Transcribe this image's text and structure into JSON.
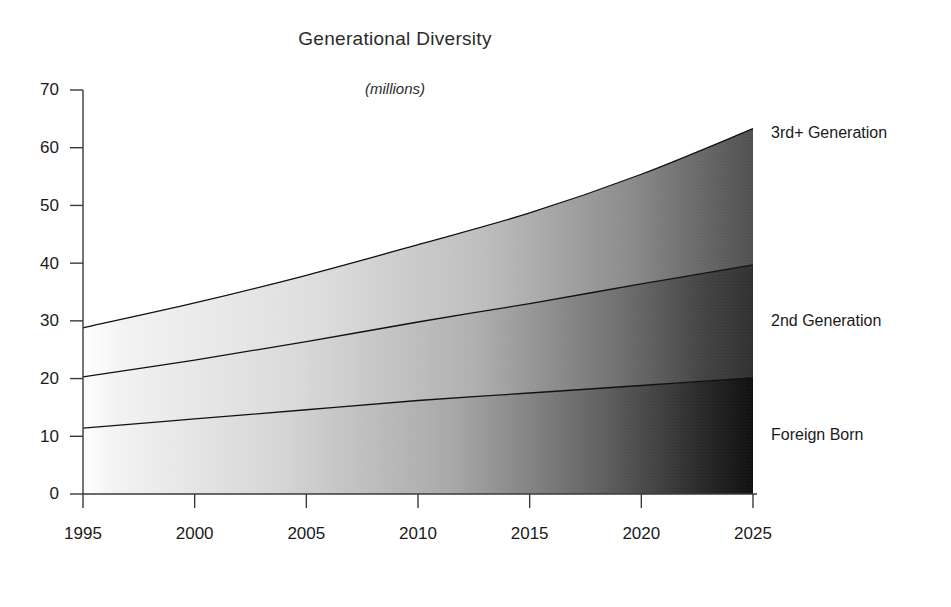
{
  "chart_data": {
    "type": "area",
    "stacked": true,
    "title": "Generational Diversity",
    "subtitle": "(millions)",
    "xlabel": "",
    "ylabel": "",
    "xlim": [
      1995,
      2025
    ],
    "ylim": [
      0,
      70
    ],
    "grid": false,
    "legend_position": "right-inline-labels",
    "x": [
      1995,
      2000,
      2005,
      2010,
      2015,
      2020,
      2025
    ],
    "xticklabels": [
      "1995",
      "2000",
      "2005",
      "2010",
      "2015",
      "2020",
      "2025"
    ],
    "yticks": [
      0,
      10,
      20,
      30,
      40,
      50,
      60,
      70
    ],
    "yticklabels": [
      "0",
      "10",
      "20",
      "30",
      "40",
      "50",
      "60",
      "70"
    ],
    "series": [
      {
        "name": "Foreign Born",
        "values": [
          11.4,
          13.0,
          14.6,
          16.2,
          17.5,
          18.8,
          20.1
        ],
        "cumulative": [
          11.4,
          13.0,
          14.6,
          16.2,
          17.5,
          18.8,
          20.1
        ],
        "shade": "darkest"
      },
      {
        "name": "2nd Generation",
        "values": [
          8.9,
          10.2,
          11.8,
          13.6,
          15.5,
          17.6,
          19.6
        ],
        "cumulative": [
          20.3,
          23.2,
          26.4,
          29.8,
          33.0,
          36.4,
          39.7
        ],
        "shade": "medium"
      },
      {
        "name": "3rd+ Generation",
        "values": [
          8.5,
          9.9,
          11.5,
          13.4,
          15.7,
          19.0,
          23.6
        ],
        "cumulative": [
          28.8,
          33.1,
          37.9,
          43.2,
          48.7,
          55.4,
          63.3
        ],
        "shade": "lightest"
      }
    ],
    "totals": [
      28.8,
      33.1,
      37.9,
      43.2,
      48.7,
      55.4,
      63.3
    ],
    "annotations": []
  },
  "labels": {
    "series_right": [
      {
        "text": "3rd+ Generation"
      },
      {
        "text": "2nd Generation"
      },
      {
        "text": "Foreign Born"
      }
    ]
  },
  "colors": {
    "axis": "#3a3a3a",
    "text": "#1a1a1a",
    "band_edge": "#111111",
    "gradient_light": "#fdfdfd",
    "gradient_dark_band1": "#141414",
    "gradient_dark_band2": "#2f2f2f",
    "gradient_dark_band3": "#4d4d4d",
    "background": "#ffffff"
  }
}
